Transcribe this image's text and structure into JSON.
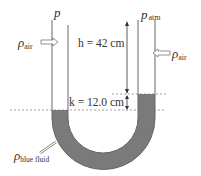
{
  "diagram": {
    "labels": {
      "p_left": "p",
      "p_atm": "p",
      "p_atm_sub": "atm",
      "rho_air_left": "ρ",
      "rho_air_left_sub": "air",
      "rho_air_right": "ρ",
      "rho_air_right_sub": "air",
      "h_label": "h = 42 cm",
      "k_label": "k = 12.0 cm",
      "rho_fluid": "ρ",
      "rho_fluid_sub": "blue fluid"
    },
    "values": {
      "h": "42 cm",
      "k": "12.0 cm"
    },
    "colors": {
      "fluid": "#7a7a7a",
      "tube": "#666666",
      "dashed": "#888888"
    }
  }
}
